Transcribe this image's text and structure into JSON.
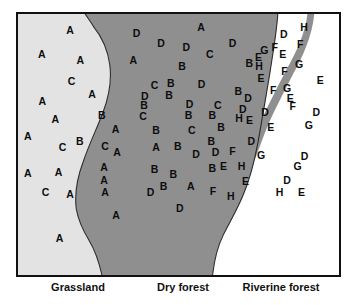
{
  "figure": {
    "kind": "habitat-distribution-map",
    "width": 359,
    "height": 305
  },
  "colors": {
    "grassland_fill": "#e3e3e3",
    "dry_forest_fill": "#8f8f8f",
    "riverine_forest_fill": "#ffffff",
    "river_fill": "#8f8f8f",
    "boundary_stroke": "#2b2b2b",
    "frame_stroke": "#111111",
    "marker_text": "#0d0d0d"
  },
  "captions": [
    {
      "label": "Grassland",
      "x": 62
    },
    {
      "label": "Dry forest",
      "x": 167
    },
    {
      "label": "Riverine forest",
      "x": 265
    }
  ],
  "zones": [
    {
      "name": "grassland",
      "label": "Grassland",
      "fill": "#e3e3e3"
    },
    {
      "name": "dry-forest",
      "label": "Dry forest",
      "fill": "#8f8f8f"
    },
    {
      "name": "riverine-forest",
      "label": "Riverine forest",
      "fill": "#ffffff"
    }
  ],
  "river": {
    "name": "river",
    "fill": "#8f8f8f"
  },
  "chart_data": {
    "type": "scatter",
    "title": "",
    "xlabel": "",
    "ylabel": "",
    "grid": false,
    "legend": "none",
    "note": "Letter-coded species occurrence points plotted over three habitat zones; coordinates are fractions of the map frame (0-1, origin top-left).",
    "categories": [
      "A",
      "B",
      "C",
      "D",
      "E",
      "F",
      "G",
      "H"
    ],
    "zone_counts": {
      "grassland": {
        "A": 19,
        "B": 2,
        "C": 5
      },
      "dry-forest": {
        "A": 3,
        "B": 21,
        "C": 6,
        "D": 14
      },
      "riverine-forest": {
        "D": 12,
        "E": 14,
        "F": 10,
        "G": 8,
        "H": 6
      }
    },
    "points": [
      {
        "label": "A",
        "x": 0.16,
        "y": 0.06,
        "zone": "grassland"
      },
      {
        "label": "A",
        "x": 0.073,
        "y": 0.15,
        "zone": "grassland"
      },
      {
        "label": "A",
        "x": 0.192,
        "y": 0.172,
        "zone": "grassland"
      },
      {
        "label": "C",
        "x": 0.165,
        "y": 0.253,
        "zone": "grassland"
      },
      {
        "label": "A",
        "x": 0.228,
        "y": 0.3,
        "zone": "grassland"
      },
      {
        "label": "A",
        "x": 0.075,
        "y": 0.33,
        "zone": "grassland"
      },
      {
        "label": "B",
        "x": 0.258,
        "y": 0.383,
        "zone": "grassland"
      },
      {
        "label": "A",
        "x": 0.115,
        "y": 0.395,
        "zone": "grassland"
      },
      {
        "label": "A",
        "x": 0.3,
        "y": 0.433,
        "zone": "grassland"
      },
      {
        "label": "A",
        "x": 0.03,
        "y": 0.462,
        "zone": "grassland"
      },
      {
        "label": "B",
        "x": 0.19,
        "y": 0.478,
        "zone": "grassland"
      },
      {
        "label": "C",
        "x": 0.137,
        "y": 0.5,
        "zone": "grassland"
      },
      {
        "label": "C",
        "x": 0.268,
        "y": 0.498,
        "zone": "grassland"
      },
      {
        "label": "A",
        "x": 0.305,
        "y": 0.522,
        "zone": "grassland"
      },
      {
        "label": "A",
        "x": 0.03,
        "y": 0.6,
        "zone": "grassland"
      },
      {
        "label": "A",
        "x": 0.125,
        "y": 0.598,
        "zone": "grassland"
      },
      {
        "label": "A",
        "x": 0.265,
        "y": 0.578,
        "zone": "grassland"
      },
      {
        "label": "A",
        "x": 0.265,
        "y": 0.625,
        "zone": "grassland"
      },
      {
        "label": "C",
        "x": 0.085,
        "y": 0.672,
        "zone": "grassland"
      },
      {
        "label": "A",
        "x": 0.16,
        "y": 0.68,
        "zone": "grassland"
      },
      {
        "label": "A",
        "x": 0.268,
        "y": 0.672,
        "zone": "grassland"
      },
      {
        "label": "A",
        "x": 0.302,
        "y": 0.76,
        "zone": "grassland"
      },
      {
        "label": "A",
        "x": 0.128,
        "y": 0.845,
        "zone": "grassland"
      },
      {
        "label": "D",
        "x": 0.365,
        "y": 0.072,
        "zone": "dry-forest"
      },
      {
        "label": "A",
        "x": 0.563,
        "y": 0.048,
        "zone": "dry-forest"
      },
      {
        "label": "D",
        "x": 0.44,
        "y": 0.108,
        "zone": "dry-forest"
      },
      {
        "label": "D",
        "x": 0.518,
        "y": 0.125,
        "zone": "dry-forest"
      },
      {
        "label": "D",
        "x": 0.66,
        "y": 0.11,
        "zone": "dry-forest"
      },
      {
        "label": "C",
        "x": 0.59,
        "y": 0.15,
        "zone": "dry-forest"
      },
      {
        "label": "A",
        "x": 0.355,
        "y": 0.175,
        "zone": "dry-forest"
      },
      {
        "label": "B",
        "x": 0.505,
        "y": 0.198,
        "zone": "dry-forest"
      },
      {
        "label": "B",
        "x": 0.712,
        "y": 0.185,
        "zone": "dry-forest"
      },
      {
        "label": "C",
        "x": 0.42,
        "y": 0.268,
        "zone": "dry-forest"
      },
      {
        "label": "B",
        "x": 0.47,
        "y": 0.262,
        "zone": "dry-forest"
      },
      {
        "label": "D",
        "x": 0.565,
        "y": 0.265,
        "zone": "dry-forest"
      },
      {
        "label": "D",
        "x": 0.39,
        "y": 0.308,
        "zone": "dry-forest"
      },
      {
        "label": "B",
        "x": 0.465,
        "y": 0.305,
        "zone": "dry-forest"
      },
      {
        "label": "B",
        "x": 0.678,
        "y": 0.29,
        "zone": "dry-forest"
      },
      {
        "label": "B",
        "x": 0.388,
        "y": 0.345,
        "zone": "dry-forest"
      },
      {
        "label": "D",
        "x": 0.528,
        "y": 0.34,
        "zone": "dry-forest"
      },
      {
        "label": "C",
        "x": 0.615,
        "y": 0.345,
        "zone": "dry-forest"
      },
      {
        "label": "C",
        "x": 0.385,
        "y": 0.385,
        "zone": "dry-forest"
      },
      {
        "label": "B",
        "x": 0.525,
        "y": 0.383,
        "zone": "dry-forest"
      },
      {
        "label": "B",
        "x": 0.598,
        "y": 0.383,
        "zone": "dry-forest"
      },
      {
        "label": "B",
        "x": 0.425,
        "y": 0.438,
        "zone": "dry-forest"
      },
      {
        "label": "C",
        "x": 0.535,
        "y": 0.438,
        "zone": "dry-forest"
      },
      {
        "label": "B",
        "x": 0.625,
        "y": 0.425,
        "zone": "dry-forest"
      },
      {
        "label": "B",
        "x": 0.595,
        "y": 0.48,
        "zone": "dry-forest"
      },
      {
        "label": "A",
        "x": 0.425,
        "y": 0.5,
        "zone": "dry-forest"
      },
      {
        "label": "B",
        "x": 0.492,
        "y": 0.498,
        "zone": "dry-forest"
      },
      {
        "label": "D",
        "x": 0.548,
        "y": 0.528,
        "zone": "dry-forest"
      },
      {
        "label": "D",
        "x": 0.608,
        "y": 0.52,
        "zone": "dry-forest"
      },
      {
        "label": "B",
        "x": 0.42,
        "y": 0.585,
        "zone": "dry-forest"
      },
      {
        "label": "B",
        "x": 0.478,
        "y": 0.605,
        "zone": "dry-forest"
      },
      {
        "label": "B",
        "x": 0.598,
        "y": 0.582,
        "zone": "dry-forest"
      },
      {
        "label": "B",
        "x": 0.448,
        "y": 0.65,
        "zone": "dry-forest"
      },
      {
        "label": "A",
        "x": 0.532,
        "y": 0.648,
        "zone": "dry-forest"
      },
      {
        "label": "D",
        "x": 0.408,
        "y": 0.672,
        "zone": "dry-forest"
      },
      {
        "label": "D",
        "x": 0.498,
        "y": 0.733,
        "zone": "dry-forest"
      },
      {
        "label": "H",
        "x": 0.88,
        "y": 0.048,
        "zone": "riverine-forest"
      },
      {
        "label": "D",
        "x": 0.818,
        "y": 0.075,
        "zone": "riverine-forest"
      },
      {
        "label": "F",
        "x": 0.868,
        "y": 0.112,
        "zone": "riverine-forest"
      },
      {
        "label": "G",
        "x": 0.758,
        "y": 0.135,
        "zone": "riverine-forest"
      },
      {
        "label": "F",
        "x": 0.79,
        "y": 0.125,
        "zone": "riverine-forest"
      },
      {
        "label": "E",
        "x": 0.815,
        "y": 0.152,
        "zone": "riverine-forest"
      },
      {
        "label": "E",
        "x": 0.74,
        "y": 0.163,
        "zone": "riverine-forest"
      },
      {
        "label": "G",
        "x": 0.865,
        "y": 0.188,
        "zone": "riverine-forest"
      },
      {
        "label": "H",
        "x": 0.742,
        "y": 0.198,
        "zone": "riverine-forest"
      },
      {
        "label": "F",
        "x": 0.82,
        "y": 0.215,
        "zone": "riverine-forest"
      },
      {
        "label": "E",
        "x": 0.748,
        "y": 0.24,
        "zone": "riverine-forest"
      },
      {
        "label": "E",
        "x": 0.93,
        "y": 0.248,
        "zone": "riverine-forest"
      },
      {
        "label": "F",
        "x": 0.785,
        "y": 0.285,
        "zone": "riverine-forest"
      },
      {
        "label": "G",
        "x": 0.828,
        "y": 0.28,
        "zone": "riverine-forest"
      },
      {
        "label": "D",
        "x": 0.708,
        "y": 0.318,
        "zone": "riverine-forest"
      },
      {
        "label": "E",
        "x": 0.838,
        "y": 0.318,
        "zone": "riverine-forest"
      },
      {
        "label": "D",
        "x": 0.692,
        "y": 0.36,
        "zone": "riverine-forest"
      },
      {
        "label": "F",
        "x": 0.845,
        "y": 0.348,
        "zone": "riverine-forest"
      },
      {
        "label": "D",
        "x": 0.76,
        "y": 0.368,
        "zone": "riverine-forest"
      },
      {
        "label": "H",
        "x": 0.68,
        "y": 0.392,
        "zone": "riverine-forest"
      },
      {
        "label": "E",
        "x": 0.712,
        "y": 0.4,
        "zone": "riverine-forest"
      },
      {
        "label": "D",
        "x": 0.918,
        "y": 0.37,
        "zone": "riverine-forest"
      },
      {
        "label": "E",
        "x": 0.778,
        "y": 0.425,
        "zone": "riverine-forest"
      },
      {
        "label": "G",
        "x": 0.895,
        "y": 0.42,
        "zone": "riverine-forest"
      },
      {
        "label": "D",
        "x": 0.718,
        "y": 0.478,
        "zone": "riverine-forest"
      },
      {
        "label": "F",
        "x": 0.66,
        "y": 0.518,
        "zone": "riverine-forest"
      },
      {
        "label": "G",
        "x": 0.748,
        "y": 0.533,
        "zone": "riverine-forest"
      },
      {
        "label": "D",
        "x": 0.882,
        "y": 0.535,
        "zone": "riverine-forest"
      },
      {
        "label": "E",
        "x": 0.632,
        "y": 0.572,
        "zone": "riverine-forest"
      },
      {
        "label": "H",
        "x": 0.688,
        "y": 0.572,
        "zone": "riverine-forest"
      },
      {
        "label": "G",
        "x": 0.86,
        "y": 0.572,
        "zone": "riverine-forest"
      },
      {
        "label": "E",
        "x": 0.7,
        "y": 0.63,
        "zone": "riverine-forest"
      },
      {
        "label": "D",
        "x": 0.828,
        "y": 0.628,
        "zone": "riverine-forest"
      },
      {
        "label": "F",
        "x": 0.6,
        "y": 0.668,
        "zone": "riverine-forest"
      },
      {
        "label": "H",
        "x": 0.655,
        "y": 0.688,
        "zone": "riverine-forest"
      },
      {
        "label": "H",
        "x": 0.805,
        "y": 0.672,
        "zone": "riverine-forest"
      },
      {
        "label": "E",
        "x": 0.872,
        "y": 0.672,
        "zone": "riverine-forest"
      }
    ]
  }
}
